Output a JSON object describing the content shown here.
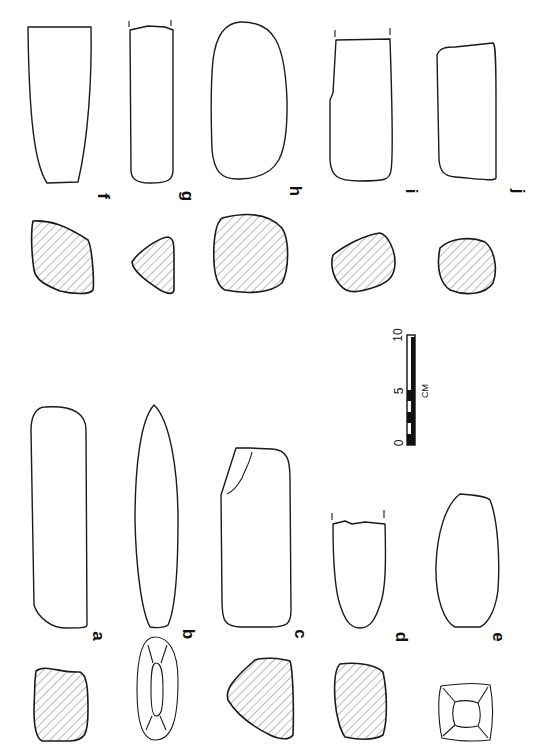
{
  "figure": {
    "type": "archaeological artifact illustration (ground stone tools, rotated 90°)",
    "top_row": {
      "labels": [
        "f",
        "g",
        "h",
        "i",
        "j"
      ]
    },
    "bottom_row": {
      "labels": [
        "a",
        "b",
        "c",
        "d",
        "e"
      ]
    },
    "scale_bar": {
      "ticks": [
        "0",
        "5",
        "10"
      ],
      "unit": "CM"
    },
    "colors": {
      "line": "#1a1a1a",
      "hatch": "#555555",
      "background": "#ffffff"
    }
  }
}
